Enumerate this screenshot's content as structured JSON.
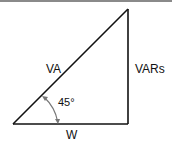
{
  "diagram": {
    "type": "power-triangle",
    "labels": {
      "hypotenuse": "VA",
      "vertical": "VARs",
      "horizontal": "W",
      "angle": "45°"
    },
    "colors": {
      "line": "#111111",
      "arc": "#777777",
      "top_border": "#8a8a8a"
    }
  }
}
